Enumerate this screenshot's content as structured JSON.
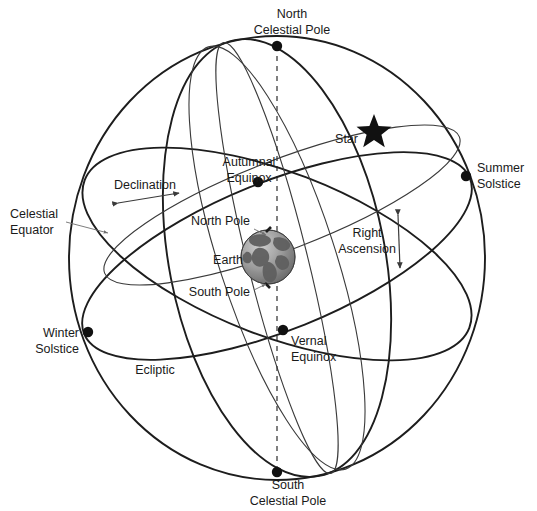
{
  "diagram": {
    "background_color": "#ffffff",
    "line_color": "#1d1d1d",
    "text_color": "#1a1a1a"
  },
  "labels": {
    "north_celestial_pole_line1": "North",
    "north_celestial_pole_line2": "Celestial Pole",
    "south_celestial_pole_line1": "South",
    "south_celestial_pole_line2": "Celestial Pole",
    "celestial_equator_line1": "Celestial",
    "celestial_equator_line2": "Equator",
    "autumnal_equinox_line1": "Autumnal",
    "autumnal_equinox_line2": "Equinox",
    "vernal_equinox_line1": "Vernal",
    "vernal_equinox_line2": "Equinox",
    "summer_solstice_line1": "Summer",
    "summer_solstice_line2": "Solstice",
    "winter_solstice_line1": "Winter",
    "winter_solstice_line2": "Solstice",
    "declination": "Declination",
    "right_ascension_line1": "Right",
    "right_ascension_line2": "Ascension",
    "ecliptic": "Ecliptic",
    "star": "Star",
    "earth": "Earth",
    "north_pole": "North Pole",
    "south_pole": "South Pole"
  },
  "icons": {
    "star": "star-icon",
    "earth": "earth-globe-icon",
    "node_point": "node-dot-icon"
  },
  "geometry": {
    "sphere_center_x": 277,
    "sphere_center_y": 258,
    "sphere_radius_x": 208,
    "sphere_radius_y": 222,
    "north_celestial_pole": [
      277,
      46
    ],
    "south_celestial_pole": [
      277,
      472
    ],
    "autumnal_equinox": [
      258,
      182
    ],
    "vernal_equinox": [
      283,
      330
    ],
    "summer_solstice": [
      466,
      176
    ],
    "winter_solstice": [
      88,
      332
    ],
    "star_point": [
      374,
      128
    ],
    "earth_center": [
      268,
      257
    ],
    "earth_radius": 27
  },
  "colors": {
    "earth_ocean": "#9a9a9a",
    "earth_land": "#5f5f5f",
    "star_fill": "#111111",
    "node_fill": "#111111",
    "thin_line": "#3a3a3a",
    "leader_line": "#6e6e6e"
  }
}
